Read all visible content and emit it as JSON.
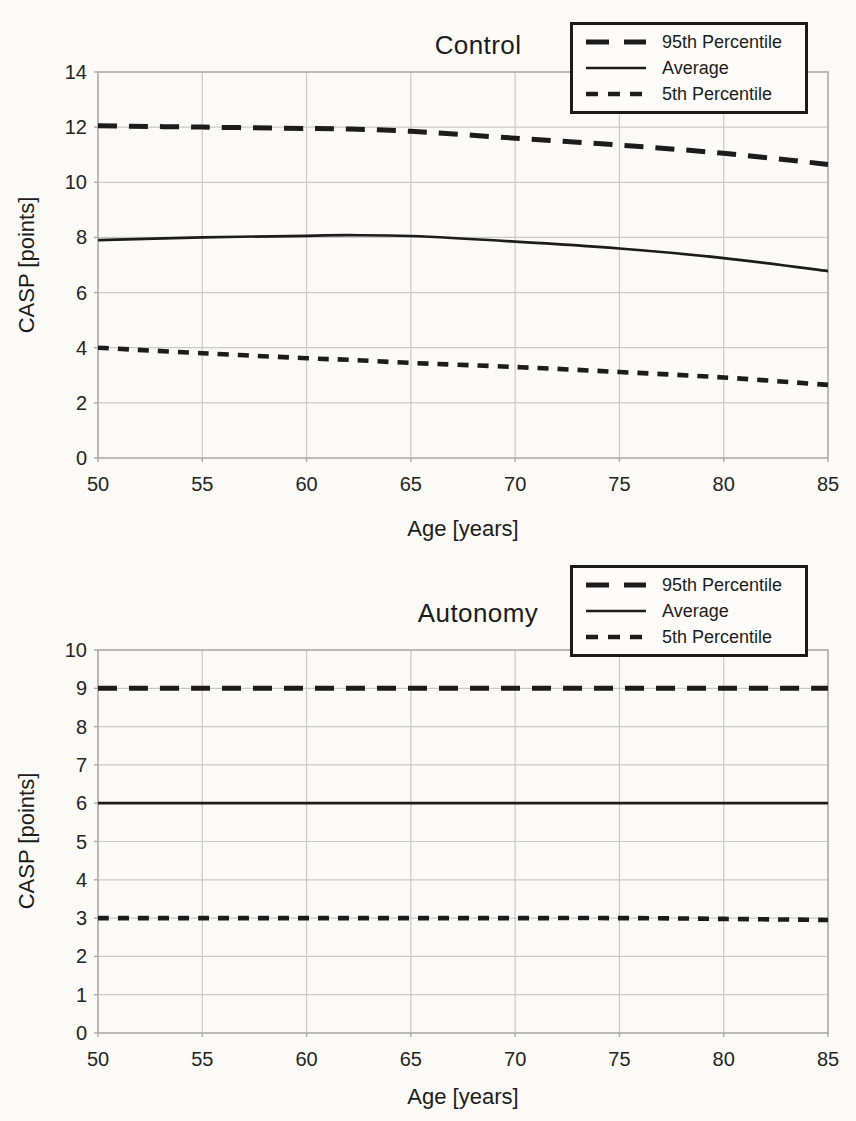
{
  "colors": {
    "ink": "#1c1c1c",
    "grid": "#c9c9c9",
    "frame": "#aaaaaa",
    "paper": "#fbfaf7"
  },
  "chart_data": [
    {
      "id": "control",
      "type": "line",
      "title": "Control",
      "xlabel": "Age [years]",
      "ylabel": "CASP [points]",
      "xlim": [
        50,
        85
      ],
      "ylim": [
        0,
        14
      ],
      "xticks": [
        50,
        55,
        60,
        65,
        70,
        75,
        80,
        85
      ],
      "yticks": [
        0,
        2,
        4,
        6,
        8,
        10,
        12,
        14
      ],
      "grid": true,
      "legend_position": "top-right",
      "x": [
        50,
        55,
        60,
        62,
        65,
        70,
        75,
        80,
        85
      ],
      "series": [
        {
          "name": "95th Percentile",
          "line_style": "long-dash",
          "values": [
            12.05,
            12.0,
            11.95,
            11.93,
            11.85,
            11.6,
            11.35,
            11.05,
            10.65
          ]
        },
        {
          "name": "Average",
          "line_style": "solid",
          "values": [
            7.9,
            8.0,
            8.06,
            8.08,
            8.05,
            7.85,
            7.6,
            7.25,
            6.78
          ]
        },
        {
          "name": "5th Percentile",
          "line_style": "short-dash",
          "values": [
            4.0,
            3.8,
            3.62,
            3.56,
            3.45,
            3.3,
            3.12,
            2.92,
            2.65
          ]
        }
      ]
    },
    {
      "id": "autonomy",
      "type": "line",
      "title": "Autonomy",
      "xlabel": "Age [years]",
      "ylabel": "CASP [points]",
      "xlim": [
        50,
        85
      ],
      "ylim": [
        0,
        10
      ],
      "xticks": [
        50,
        55,
        60,
        65,
        70,
        75,
        80,
        85
      ],
      "yticks": [
        0,
        1,
        2,
        3,
        4,
        5,
        6,
        7,
        8,
        9,
        10
      ],
      "grid": true,
      "legend_position": "top-right",
      "x": [
        50,
        55,
        60,
        65,
        70,
        75,
        80,
        85
      ],
      "series": [
        {
          "name": "95th Percentile",
          "line_style": "long-dash",
          "values": [
            9.0,
            9.0,
            9.0,
            9.0,
            9.0,
            9.0,
            9.0,
            9.0
          ]
        },
        {
          "name": "Average",
          "line_style": "solid",
          "values": [
            6.0,
            6.0,
            6.0,
            6.0,
            6.0,
            6.0,
            6.0,
            6.0
          ]
        },
        {
          "name": "5th Percentile",
          "line_style": "short-dash",
          "values": [
            3.0,
            3.0,
            3.0,
            3.0,
            3.0,
            3.0,
            2.98,
            2.95
          ]
        }
      ]
    }
  ]
}
